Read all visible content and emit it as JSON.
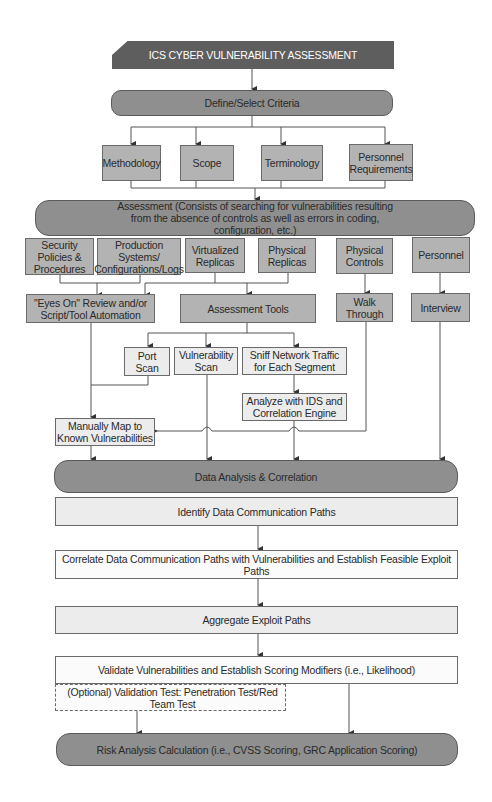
{
  "diagram": {
    "title": "ICS CYBER VULNERABILITY ASSESSMENT",
    "define_criteria": "Define/Select Criteria",
    "criteria": [
      {
        "label": "Methodology"
      },
      {
        "label": "Scope"
      },
      {
        "label": "Terminology"
      },
      {
        "label": "Personnel Requirements"
      }
    ],
    "assessment": "Assessment (Consists of searching for vulnerabilities resulting from the absence of controls as well as errors in coding, configuration, etc.)",
    "sources": [
      {
        "label": "Security Policies & Procedures"
      },
      {
        "label": "Production Systems/ Configurations/Logs"
      },
      {
        "label": "Virtualized Replicas"
      },
      {
        "label": "Physical Replicas"
      },
      {
        "label": "Physical Controls"
      },
      {
        "label": "Personnel"
      }
    ],
    "methods": {
      "eyes_on": "\"Eyes On\" Review and/or Script/Tool Automation",
      "assessment_tools": "Assessment Tools",
      "walk_through": "Walk Through",
      "interview": "Interview"
    },
    "tools": {
      "port_scan": "Port Scan",
      "vulnerability_scan": "Vulnerability Scan",
      "sniff_traffic": "Sniff Network Traffic for Each Segment",
      "analyze_ids": "Analyze with IDS and Correlation Engine",
      "manual_map": "Manually Map to Known Vulnerabilities"
    },
    "data_analysis": "Data Analysis & Correlation",
    "steps": {
      "identify_paths": "Identify Data Communication Paths",
      "correlate_paths": "Correlate Data Communication Paths with Vulnerabilities and Establish Feasible Exploit Paths",
      "aggregate_paths": "Aggregate Exploit Paths",
      "validate": "Validate Vulnerabilities and Establish Scoring Modifiers (i.e., Likelihood)",
      "optional_test": "(Optional) Validation Test: Penetration Test/Red Team Test"
    },
    "risk_analysis": "Risk Analysis Calculation (i.e., CVSS Scoring, GRC Application Scoring)",
    "colors": {
      "banner": "#5e5e5e",
      "pill": "#8f8f8f",
      "mid_box": "#b3b3b3",
      "light_box": "#ececec",
      "line": "#555555"
    }
  }
}
